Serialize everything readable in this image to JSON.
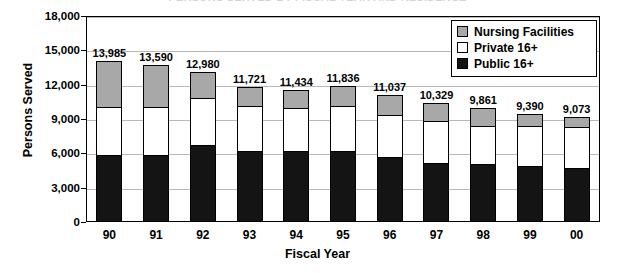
{
  "chart_data": {
    "type": "bar",
    "subtype": "stacked-vertical",
    "title": "PERSONS SERVED BY FISCAL YEAR AND RESIDENCE",
    "xlabel": "Fiscal Year",
    "ylabel": "Persons Served",
    "categories": [
      "90",
      "91",
      "92",
      "93",
      "94",
      "95",
      "96",
      "97",
      "98",
      "99",
      "00"
    ],
    "ylim": [
      0,
      18000
    ],
    "yticks": [
      0,
      3000,
      6000,
      9000,
      12000,
      15000,
      18000
    ],
    "ytick_labels": [
      "0",
      "3,000",
      "6,000",
      "9,000",
      "12,000",
      "15,000",
      "18,000"
    ],
    "grid": true,
    "legend_position": "top-right",
    "stack_order_bottom_to_top": [
      "Public 16+",
      "Private 16+",
      "Nursing Facilities"
    ],
    "series": [
      {
        "name": "Public 16+",
        "color": "#141414",
        "values": [
          5750,
          5800,
          6600,
          6150,
          6100,
          6150,
          5600,
          5050,
          4950,
          4800,
          4600
        ]
      },
      {
        "name": "Private 16+",
        "color": "#ffffff",
        "values": [
          4250,
          4200,
          4180,
          3871,
          3734,
          3886,
          3637,
          3679,
          3311,
          3490,
          3573
        ]
      },
      {
        "name": "Nursing Facilities",
        "color": "#a8a8a8",
        "values": [
          3985,
          3590,
          2200,
          1700,
          1600,
          1800,
          1800,
          1600,
          1600,
          1100,
          900
        ]
      }
    ],
    "totals": [
      13985,
      13590,
      12980,
      11721,
      11434,
      11836,
      11037,
      10329,
      9861,
      9390,
      9073
    ],
    "total_labels": [
      "13,985",
      "13,590",
      "12,980",
      "11,721",
      "11,434",
      "11,836",
      "11,037",
      "10,329",
      "9,861",
      "9,390",
      "9,073"
    ]
  },
  "legend": {
    "items": [
      {
        "label": "Nursing Facilities",
        "swatch": "gray-swatch-icon"
      },
      {
        "label": "Private 16+",
        "swatch": "white-swatch-icon"
      },
      {
        "label": "Public 16+",
        "swatch": "black-swatch-icon"
      }
    ]
  }
}
